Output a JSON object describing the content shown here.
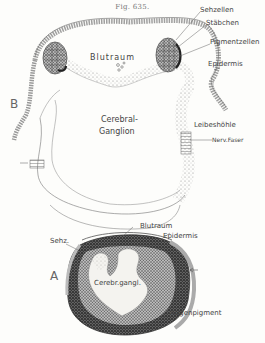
{
  "figure": {
    "title": "Fig. 635.",
    "panels": [
      {
        "id": "B",
        "letter": "B",
        "labels": {
          "sehzellen": "Sehzellen",
          "staebchen": "Stäbchen",
          "pigmentzellen": "Pigmentzellen",
          "epidermis": "Epidermis",
          "blutraum": "Blutraum",
          "cerebral": "Cerebral-",
          "ganglion": "Ganglion",
          "leibeshoehle": "Leibeshöhle",
          "nervfaser": "Nerv.Faser"
        }
      },
      {
        "id": "A",
        "letter": "A",
        "labels": {
          "blutraum": "Blutraum",
          "sehz": "Sehz.",
          "epidermis": "Epidermis",
          "cerebrganglion": "Cerebr.gangl.",
          "augenpigment": "Augenpigment"
        }
      }
    ]
  },
  "colors": {
    "ink": "#555555",
    "stipple": "#888888",
    "dark_pigment": "#333333",
    "paper": "#fdfdfb"
  }
}
